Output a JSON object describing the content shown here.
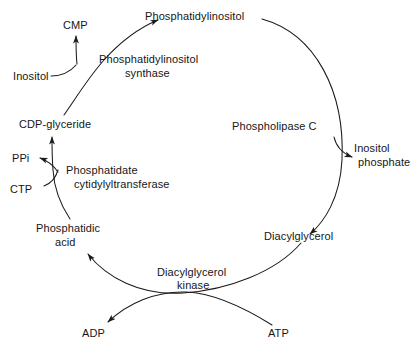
{
  "diagram": {
    "type": "cyclic-pathway",
    "stroke_color": "#1a1a1a",
    "background_color": "#ffffff",
    "metabolites": {
      "phosphatidylinositol": "Phosphatidylinositol",
      "inositol_phosphate_line1": "Inositol",
      "inositol_phosphate_line2": "phosphate",
      "diacylglycerol": "Diacylglycerol",
      "atp": "ATP",
      "adp": "ADP",
      "phosphatidic_acid_line1": "Phosphatidic",
      "phosphatidic_acid_line2": "acid",
      "ctp": "CTP",
      "ppi": "PPi",
      "cdp_glyceride": "CDP-glyceride",
      "inositol": "Inositol",
      "cmp": "CMP"
    },
    "enzymes": {
      "phospholipase_c": "Phospholipase C",
      "diacylglycerol_kinase_line1": "Diacylglycerol",
      "diacylglycerol_kinase_line2": "kinase",
      "phosphatidate_cytidylyltransferase_line1": "Phosphatidate",
      "phosphatidate_cytidylyltransferase_line2": "cytidylyltransferase",
      "phosphatidylinositol_synthase_line1": "Phosphatidylinositol",
      "phosphatidylinositol_synthase_line2": "synthase"
    }
  }
}
